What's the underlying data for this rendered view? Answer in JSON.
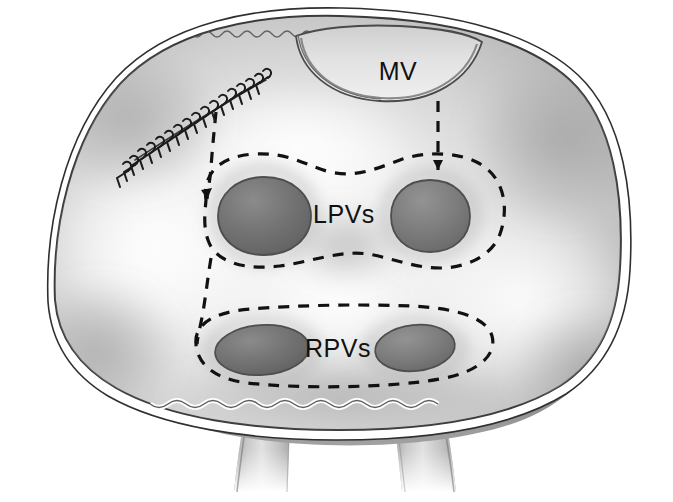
{
  "figure": {
    "view": "interior of left atrium, posterior wall opened",
    "background_color": "#ffffff"
  },
  "labels": {
    "mitral_valve": "MV",
    "left_pulmonary_veins": "LPVs",
    "right_pulmonary_veins": "RPVs"
  },
  "structures": {
    "atrial_wall": {
      "name": "left-atrial-wall",
      "fill_light": "#f2f2f2",
      "fill_mid": "#c9c9c9",
      "fill_dark": "#9a9a9a",
      "edge_color": "#3a3a3a",
      "rim_color": "#ffffff"
    },
    "mitral_valve_orifice": {
      "name": "mitral-valve-orifice",
      "label": "MV",
      "outline_color": "#4a4a4a"
    },
    "vein_ostia": [
      {
        "name": "lpv-superior-ostium",
        "group": "LPVs",
        "shape": "circle",
        "fill": "#6e6e6e"
      },
      {
        "name": "lpv-inferior-ostium",
        "group": "LPVs",
        "shape": "circle",
        "fill": "#6e6e6e"
      },
      {
        "name": "rpv-superior-ostium",
        "group": "RPVs",
        "shape": "ellipse",
        "fill": "#767676"
      },
      {
        "name": "rpv-inferior-ostium",
        "group": "RPVs",
        "shape": "ellipse",
        "fill": "#767676"
      }
    ],
    "descending_vessels": [
      {
        "name": "vessel-left-trunk",
        "fill": "#b5b5b5"
      },
      {
        "name": "vessel-right-trunk",
        "fill": "#b5b5b5"
      }
    ]
  },
  "annotations": {
    "lesion_lines": {
      "style": "dashed",
      "color": "#111111",
      "dash_pattern": "11 9",
      "stroke_width": 3.2,
      "items": [
        {
          "name": "lpv-encircling-lesion",
          "encircles": "LPVs"
        },
        {
          "name": "rpv-encircling-lesion",
          "encircles": "RPVs"
        },
        {
          "name": "mitral-isthmus-connecting-lesion",
          "from": "MV",
          "to": "LPVs"
        },
        {
          "name": "inter-venous-connecting-lesion",
          "from": "LPVs",
          "to": "RPVs"
        },
        {
          "name": "roof-to-suture-connecting-lesion",
          "from": "suture-line",
          "to": "LPVs"
        }
      ]
    },
    "suture_line": {
      "name": "running-suture-line",
      "style": "running-over-and-over-stitch",
      "color": "#1b1b1b",
      "stitch_count": 26
    }
  },
  "colors": {
    "ink": "#111111",
    "tissue_highlight": "#f4f4f4",
    "tissue_mid": "#c4c4c4",
    "tissue_shadow": "#8d8d8d",
    "ostium_dark": "#6e6e6e",
    "outline": "#3a3a3a"
  }
}
